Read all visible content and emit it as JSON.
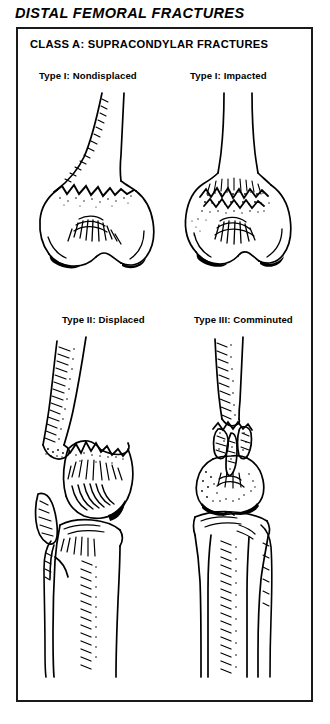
{
  "page": {
    "title": "DISTAL FEMORAL FRACTURES",
    "background_color": "#ffffff",
    "ink_color": "#000000"
  },
  "figure": {
    "class_heading": "CLASS A: SUPRACONDYLAR FRACTURES",
    "border_color": "#1a1a1a",
    "panels": [
      {
        "id": "type-1-nondisplaced",
        "label": "Type I: Nondisplaced",
        "position": "top-left",
        "illustration": "distal-femur-ap-nondisplaced-fracture"
      },
      {
        "id": "type-1-impacted",
        "label": "Type I: Impacted",
        "position": "top-right",
        "illustration": "distal-femur-ap-impacted-fracture"
      },
      {
        "id": "type-2-displaced",
        "label": "Type II: Displaced",
        "position": "bottom-left",
        "illustration": "knee-lateral-displaced-supracondylar-fracture"
      },
      {
        "id": "type-3-comminuted",
        "label": "Type III: Comminuted",
        "position": "bottom-right",
        "illustration": "knee-ap-comminuted-supracondylar-fracture"
      }
    ]
  }
}
